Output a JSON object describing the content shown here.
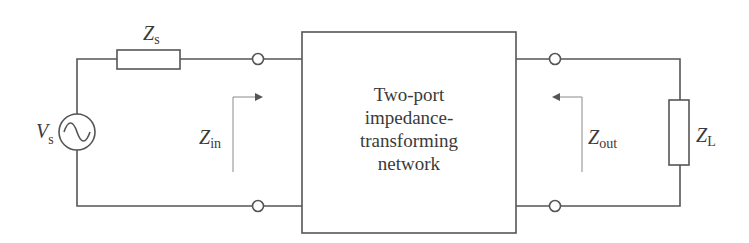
{
  "diagram": {
    "type": "circuit",
    "colors": {
      "wire": "#555555",
      "arrow": "#888888",
      "text": "#3a3a3a",
      "background": "#ffffff"
    },
    "source": {
      "symbol": "V",
      "subscript": "s",
      "icon": "ac-source-icon"
    },
    "source_impedance": {
      "symbol": "Z",
      "subscript": "s",
      "icon": "resistor-icon"
    },
    "input_impedance": {
      "symbol": "Z",
      "subscript": "in",
      "arrow": "right"
    },
    "network": {
      "lines": [
        "Two-port",
        "impedance-",
        "transforming",
        "network"
      ]
    },
    "output_impedance": {
      "symbol": "Z",
      "subscript": "out",
      "arrow": "left"
    },
    "load": {
      "symbol": "Z",
      "subscript": "L",
      "icon": "resistor-icon"
    }
  }
}
